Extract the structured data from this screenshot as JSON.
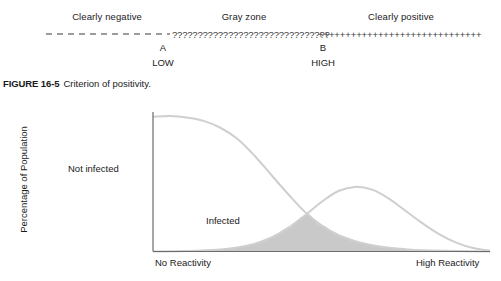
{
  "criterion": {
    "zones": [
      {
        "id": "negative",
        "label": "Clearly negative"
      },
      {
        "id": "gray",
        "label": "Gray zone"
      },
      {
        "id": "positive",
        "label": "Clearly positive"
      }
    ],
    "markers": [
      {
        "letter": "A",
        "sub": "LOW"
      },
      {
        "letter": "B",
        "sub": "HIGH"
      }
    ],
    "line_segments": {
      "negative_style": "dashed",
      "gray_glyph": "?",
      "positive_glyph": "+"
    },
    "colors": {
      "line": "#3a3a3a",
      "text": "#1a1a1a"
    }
  },
  "figure": {
    "number": "FIGURE 16-5",
    "caption": "Criterion of positivity."
  },
  "chart_data": {
    "type": "line",
    "title": "",
    "xlabel": "",
    "ylabel": "Percentage of Population",
    "xtick_labels": [
      "No Reactivity",
      "High Reactivity"
    ],
    "grid": false,
    "legend": "inline-annotations",
    "annotations": [
      {
        "text": "Not infected",
        "x": 0.12,
        "y": 0.55
      },
      {
        "text": "Infected",
        "x": 0.5,
        "y": 0.28
      }
    ],
    "xlim": [
      0,
      1
    ],
    "ylim": [
      0,
      1
    ],
    "series": [
      {
        "name": "Not infected",
        "color": "#cfcfcf",
        "x": [
          0.0,
          0.05,
          0.1,
          0.15,
          0.2,
          0.25,
          0.3,
          0.35,
          0.4,
          0.45,
          0.5,
          0.55,
          0.6,
          0.65,
          0.7,
          0.75,
          0.8,
          0.9,
          1.0
        ],
        "values": [
          0.98,
          0.985,
          0.975,
          0.95,
          0.9,
          0.82,
          0.7,
          0.56,
          0.42,
          0.29,
          0.19,
          0.12,
          0.075,
          0.045,
          0.027,
          0.016,
          0.009,
          0.003,
          0.0
        ]
      },
      {
        "name": "Infected",
        "color": "#cfcfcf",
        "x": [
          0.0,
          0.1,
          0.2,
          0.25,
          0.3,
          0.35,
          0.4,
          0.45,
          0.5,
          0.55,
          0.6,
          0.65,
          0.7,
          0.75,
          0.8,
          0.85,
          0.9,
          0.95,
          1.0
        ],
        "values": [
          0.0,
          0.004,
          0.015,
          0.03,
          0.055,
          0.1,
          0.17,
          0.26,
          0.36,
          0.44,
          0.47,
          0.45,
          0.385,
          0.295,
          0.205,
          0.125,
          0.065,
          0.025,
          0.005
        ]
      }
    ],
    "shaded_overlap": {
      "label": "overlap",
      "color": "#c9c9c9",
      "description": "region under the minimum of both curves"
    }
  }
}
